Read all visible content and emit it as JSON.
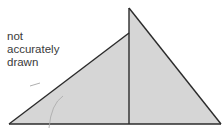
{
  "diagram": {
    "note_lines": [
      "not",
      "accurately",
      "drawn"
    ],
    "fill_color": "#d6d6d6",
    "stroke_color": "#2b2b2b",
    "shapes": [
      {
        "name": "left-triangle",
        "points": [
          [
            9,
            124
          ],
          [
            129,
            33
          ],
          [
            129,
            124
          ]
        ]
      },
      {
        "name": "right-triangle",
        "points": [
          [
            129,
            8
          ],
          [
            221,
            124
          ],
          [
            129,
            124
          ]
        ]
      }
    ]
  }
}
